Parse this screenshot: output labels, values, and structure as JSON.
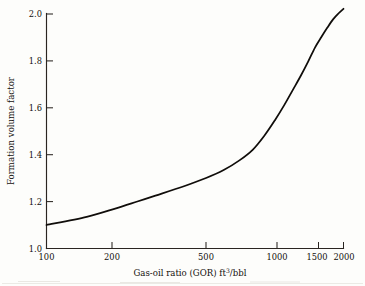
{
  "figure": {
    "name": "oil-formation-volume-factor-chart",
    "background_color": "#fdfdfb",
    "ink_color": "#100d0a"
  },
  "axes": {
    "x_title_main": "Gas-oil ratio (GOR) ft",
    "x_title_sup": "3",
    "x_title_tail": "/bbl",
    "y_title": "Formation volume factor",
    "x_tick_labels": [
      "100",
      "200",
      "500",
      "1000",
      "1500",
      "2000"
    ],
    "y_tick_labels": [
      "1.0",
      "1.2",
      "1.4",
      "1.6",
      "1.8",
      "2.0"
    ]
  },
  "chart_data": {
    "type": "line",
    "title": "",
    "subtitle": "",
    "xlabel": "Gas-oil ratio (GOR) ft3/bbl",
    "ylabel": "Formation volume factor",
    "xscale": "log",
    "yscale": "linear",
    "xlim": [
      100,
      2000
    ],
    "ylim": [
      1.0,
      2.0
    ],
    "xticks": [
      100,
      200,
      500,
      1000,
      1500,
      2000
    ],
    "yticks": [
      1.0,
      1.2,
      1.4,
      1.6,
      1.8,
      2.0
    ],
    "grid": false,
    "legend": false,
    "legend_position": "none",
    "annotations": [],
    "series": [
      {
        "name": "Formation volume factor",
        "x": [
          100,
          150,
          200,
          250,
          300,
          400,
          500,
          600,
          700,
          800,
          900,
          1000,
          1100,
          1200,
          1300,
          1400,
          1500,
          1600,
          1700,
          1800,
          1900,
          2000
        ],
        "values": [
          1.1,
          1.135,
          1.17,
          1.2,
          1.225,
          1.265,
          1.3,
          1.335,
          1.375,
          1.42,
          1.48,
          1.545,
          1.61,
          1.675,
          1.735,
          1.795,
          1.855,
          1.9,
          1.94,
          1.975,
          2.0,
          2.02
        ]
      }
    ]
  }
}
